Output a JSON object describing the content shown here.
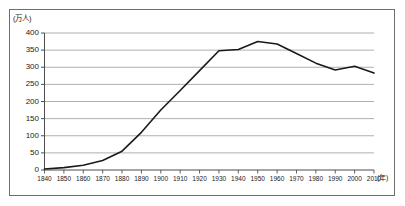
{
  "chart_data": {
    "type": "line",
    "title": "",
    "xlabel": "(年)",
    "ylabel": "(万人)",
    "y_unit": "(万人)",
    "x_unit": "(年)",
    "x": [
      1840,
      1850,
      1860,
      1870,
      1880,
      1890,
      1900,
      1910,
      1920,
      1930,
      1940,
      1950,
      1960,
      1970,
      1980,
      1990,
      2000,
      2010
    ],
    "values": [
      3,
      7,
      14,
      28,
      55,
      110,
      175,
      232,
      290,
      348,
      352,
      375,
      368,
      340,
      312,
      292,
      303,
      283
    ],
    "series": [
      {
        "name": "",
        "values": [
          3,
          7,
          14,
          28,
          55,
          110,
          175,
          232,
          290,
          348,
          352,
          375,
          368,
          340,
          312,
          292,
          303,
          283
        ]
      }
    ],
    "categories": [
      "1840",
      "1850",
      "1860",
      "1870",
      "1880",
      "1890",
      "1900",
      "1910",
      "1920",
      "1930",
      "1940",
      "1950",
      "1960",
      "1970",
      "1980",
      "1990",
      "2000",
      "2010"
    ],
    "xlim": [
      1840,
      2010
    ],
    "ylim": [
      0,
      400
    ],
    "y_ticks": [
      0,
      50,
      100,
      150,
      200,
      250,
      300,
      350,
      400
    ],
    "y_tick_labels": [
      "0",
      "50",
      "100",
      "150",
      "200",
      "250",
      "300",
      "350",
      "400"
    ],
    "x_tick_labels": [
      "1840",
      "1850",
      "1860",
      "1870",
      "1880",
      "1890",
      "1900",
      "1910",
      "1920",
      "1930",
      "1940",
      "1950",
      "1960",
      "1970",
      "1980",
      "1990",
      "2000",
      "2010"
    ],
    "grid": true,
    "grid_axis": "y",
    "legend": false,
    "legend_position": "none",
    "line_color": "#1a1a1a",
    "grid_color": "#9a9a9a",
    "axis_color": "#4d4d4d",
    "frame_color": "#6e6e6e",
    "background_color": "#ffffff",
    "annotations": []
  }
}
